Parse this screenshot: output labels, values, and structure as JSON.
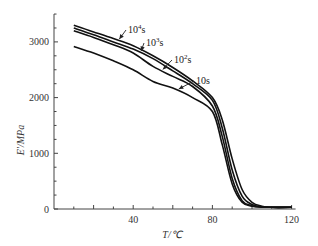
{
  "chart_data": {
    "type": "line",
    "title": "",
    "xlabel": "T/℃",
    "ylabel": "E'/MPa",
    "xlim": [
      0,
      120
    ],
    "ylim": [
      0,
      3500
    ],
    "xticks": [
      40,
      80,
      120
    ],
    "yticks": [
      0,
      1000,
      2000,
      3000
    ],
    "grid": false,
    "legend_position": "inline annotations with arrows",
    "x": [
      10,
      20,
      30,
      40,
      50,
      60,
      70,
      80,
      85,
      90,
      95,
      100,
      105,
      110,
      120
    ],
    "series": [
      {
        "name": "10^4 s",
        "label_base": "10",
        "label_exp": "4",
        "label_unit": "s",
        "values": [
          3300,
          3180,
          3060,
          2930,
          2750,
          2540,
          2300,
          2000,
          1600,
          900,
          350,
          120,
          50,
          30,
          30
        ]
      },
      {
        "name": "10^3 s",
        "label_base": "10",
        "label_exp": "3",
        "label_unit": "s",
        "values": [
          3250,
          3130,
          3000,
          2870,
          2700,
          2480,
          2250,
          1950,
          1450,
          700,
          230,
          80,
          40,
          30,
          30
        ]
      },
      {
        "name": "10^2 s",
        "label_base": "10",
        "label_exp": "2",
        "label_unit": "s",
        "values": [
          3200,
          3080,
          2950,
          2800,
          2560,
          2380,
          2200,
          1850,
          1300,
          550,
          150,
          60,
          35,
          30,
          30
        ]
      },
      {
        "name": "10 s",
        "label_base": "10s",
        "label_exp": "",
        "label_unit": "",
        "values": [
          2920,
          2800,
          2660,
          2500,
          2290,
          2170,
          2000,
          1750,
          1150,
          450,
          120,
          50,
          35,
          30,
          30
        ]
      }
    ],
    "annotations": [
      {
        "series": "10^4 s",
        "text_x": 128,
        "text_y": 33,
        "arrow_to_T": 32
      },
      {
        "series": "10^3 s",
        "text_x": 146,
        "text_y": 46,
        "arrow_to_T": 43
      },
      {
        "series": "10^2 s",
        "text_x": 174,
        "text_y": 63,
        "arrow_to_T": 54
      },
      {
        "series": "10 s",
        "text_x": 196,
        "text_y": 84,
        "arrow_to_T": 62
      }
    ]
  }
}
